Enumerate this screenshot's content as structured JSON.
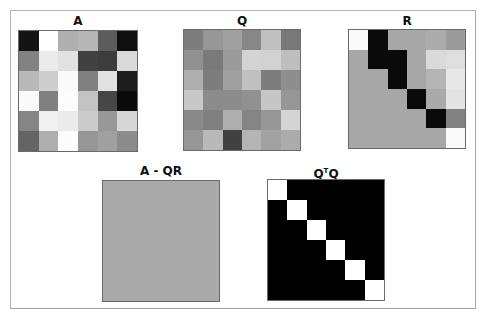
{
  "chart_data": [
    {
      "type": "heatmap",
      "title": "A",
      "rows": 6,
      "cols": 6,
      "colormap": "gray",
      "values_gray_0_255": [
        [
          20,
          255,
          175,
          182,
          92,
          15
        ],
        [
          130,
          235,
          225,
          65,
          60,
          218
        ],
        [
          185,
          205,
          250,
          128,
          225,
          28
        ],
        [
          250,
          128,
          252,
          195,
          70,
          10
        ],
        [
          132,
          240,
          235,
          203,
          152,
          215
        ],
        [
          100,
          175,
          252,
          150,
          160,
          140
        ]
      ]
    },
    {
      "type": "heatmap",
      "title": "Q",
      "rows": 6,
      "cols": 6,
      "colormap": "gray",
      "values_gray_0_255": [
        [
          125,
          150,
          160,
          135,
          192,
          120
        ],
        [
          145,
          122,
          155,
          212,
          210,
          190
        ],
        [
          175,
          125,
          160,
          192,
          125,
          142
        ],
        [
          200,
          140,
          140,
          145,
          198,
          150
        ],
        [
          138,
          128,
          175,
          132,
          150,
          212
        ],
        [
          150,
          185,
          65,
          180,
          162,
          172
        ]
      ]
    },
    {
      "type": "heatmap",
      "title": "R",
      "rows": 6,
      "cols": 6,
      "colormap": "gray",
      "note": "upper triangular; lower triangle uniform gray",
      "values_gray_0_255": [
        [
          250,
          10,
          167,
          167,
          172,
          155
        ],
        [
          167,
          10,
          10,
          167,
          218,
          222
        ],
        [
          167,
          167,
          10,
          167,
          180,
          232
        ],
        [
          167,
          167,
          167,
          10,
          170,
          228
        ],
        [
          167,
          167,
          167,
          167,
          10,
          130
        ],
        [
          167,
          167,
          167,
          167,
          167,
          250
        ]
      ]
    },
    {
      "type": "heatmap",
      "title": "A - QR",
      "rows": 1,
      "cols": 1,
      "colormap": "gray",
      "note": "uniform (all zeros)",
      "values_gray_0_255": [
        [
          170
        ]
      ]
    },
    {
      "type": "heatmap",
      "title": "QTQ",
      "rows": 6,
      "cols": 6,
      "colormap": "gray",
      "note": "identity matrix",
      "values_gray_0_255": [
        [
          255,
          0,
          0,
          0,
          0,
          0
        ],
        [
          0,
          255,
          0,
          0,
          0,
          0
        ],
        [
          0,
          0,
          255,
          0,
          0,
          0
        ],
        [
          0,
          0,
          0,
          255,
          0,
          0
        ],
        [
          0,
          0,
          0,
          0,
          255,
          0
        ],
        [
          0,
          0,
          0,
          0,
          0,
          255
        ]
      ]
    }
  ],
  "panels": {
    "a": {
      "title": "A"
    },
    "q": {
      "title": "Q"
    },
    "r": {
      "title": "R"
    },
    "residual": {
      "title": "A - QR",
      "fill": "#aaaaaa"
    },
    "qtq": {
      "title_main": "Q",
      "title_sup": "T",
      "title_end": "Q"
    }
  }
}
